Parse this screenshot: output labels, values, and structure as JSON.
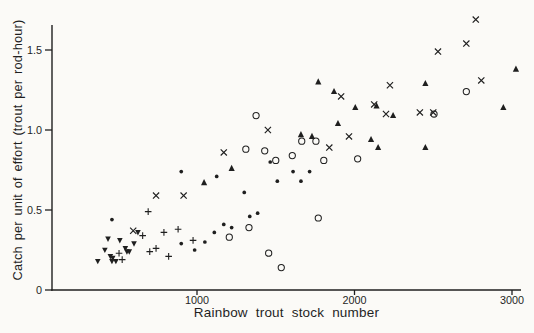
{
  "figure": {
    "background": "#fbfaf7",
    "ink_color": "#1f1f1f"
  },
  "chart_data": {
    "type": "scatter",
    "title": "",
    "xlabel": "Rainbow trout stock number",
    "ylabel": "Catch per unit of effort (trout per rod-hour)",
    "xlim": [
      80,
      3140
    ],
    "ylim": [
      0,
      1.66
    ],
    "x_ticks": [
      1000,
      2000,
      3000
    ],
    "x_tick_labels": [
      "1000",
      "2000",
      "3000"
    ],
    "y_ticks": [
      0,
      0.5,
      1.0,
      1.5
    ],
    "y_tick_labels": [
      "0",
      "0.5",
      "1.0",
      "1.5"
    ],
    "grid": false,
    "legend": "none",
    "series": [
      {
        "name": "x-cross-marks",
        "marker": "x-cross",
        "points": [
          [
            595,
            0.37
          ],
          [
            740,
            0.59
          ],
          [
            915,
            0.59
          ],
          [
            1170,
            0.86
          ],
          [
            1450,
            1.0
          ],
          [
            1915,
            1.21
          ],
          [
            2225,
            1.28
          ],
          [
            1965,
            0.96
          ],
          [
            1840,
            0.89
          ],
          [
            2125,
            1.16
          ],
          [
            2200,
            1.1
          ],
          [
            2415,
            1.11
          ],
          [
            2500,
            1.11
          ],
          [
            2530,
            1.49
          ],
          [
            2710,
            1.54
          ],
          [
            2770,
            1.69
          ],
          [
            2805,
            1.31
          ]
        ]
      },
      {
        "name": "open-circles",
        "marker": "circle-open",
        "points": [
          [
            1310,
            0.88
          ],
          [
            1430,
            0.87
          ],
          [
            1500,
            0.81
          ],
          [
            1375,
            1.09
          ],
          [
            1665,
            0.93
          ],
          [
            1755,
            0.93
          ],
          [
            1605,
            0.84
          ],
          [
            1805,
            0.81
          ],
          [
            2020,
            0.82
          ],
          [
            2710,
            1.24
          ],
          [
            2505,
            1.1
          ],
          [
            1330,
            0.39
          ],
          [
            1205,
            0.33
          ],
          [
            1770,
            0.45
          ],
          [
            1455,
            0.23
          ],
          [
            1535,
            0.14
          ]
        ]
      },
      {
        "name": "filled-up-triangles",
        "marker": "triangle-up-filled",
        "points": [
          [
            1045,
            0.67
          ],
          [
            1220,
            0.76
          ],
          [
            1770,
            1.3
          ],
          [
            1870,
            1.24
          ],
          [
            2005,
            1.14
          ],
          [
            2140,
            1.15
          ],
          [
            2245,
            1.09
          ],
          [
            1895,
            1.04
          ],
          [
            1660,
            0.97
          ],
          [
            1730,
            0.96
          ],
          [
            2105,
            0.94
          ],
          [
            2150,
            0.89
          ],
          [
            2450,
            1.29
          ],
          [
            3025,
            1.38
          ],
          [
            2945,
            1.14
          ],
          [
            2450,
            0.89
          ]
        ]
      },
      {
        "name": "small-filled-dots",
        "marker": "dot-filled",
        "points": [
          [
            460,
            0.44
          ],
          [
            900,
            0.74
          ],
          [
            1125,
            0.71
          ],
          [
            1300,
            0.61
          ],
          [
            1335,
            0.46
          ],
          [
            1385,
            0.48
          ],
          [
            1170,
            0.41
          ],
          [
            1220,
            0.39
          ],
          [
            1110,
            0.36
          ],
          [
            1050,
            0.3
          ],
          [
            900,
            0.29
          ],
          [
            985,
            0.25
          ],
          [
            1465,
            0.8
          ],
          [
            1610,
            0.74
          ],
          [
            1715,
            0.74
          ],
          [
            1510,
            0.68
          ],
          [
            1660,
            0.68
          ]
        ]
      },
      {
        "name": "plus-marks",
        "marker": "plus",
        "points": [
          [
            655,
            0.34
          ],
          [
            505,
            0.23
          ],
          [
            525,
            0.19
          ],
          [
            880,
            0.38
          ],
          [
            790,
            0.36
          ],
          [
            975,
            0.31
          ],
          [
            740,
            0.26
          ],
          [
            700,
            0.24
          ],
          [
            820,
            0.21
          ],
          [
            690,
            0.49
          ]
        ]
      },
      {
        "name": "filled-down-triangles",
        "marker": "triangle-down-filled",
        "points": [
          [
            625,
            0.36
          ],
          [
            435,
            0.32
          ],
          [
            510,
            0.31
          ],
          [
            600,
            0.29
          ],
          [
            545,
            0.26
          ],
          [
            415,
            0.25
          ],
          [
            555,
            0.24
          ],
          [
            570,
            0.24
          ],
          [
            450,
            0.21
          ],
          [
            465,
            0.2
          ],
          [
            370,
            0.18
          ],
          [
            460,
            0.18
          ],
          [
            485,
            0.18
          ]
        ]
      }
    ]
  }
}
